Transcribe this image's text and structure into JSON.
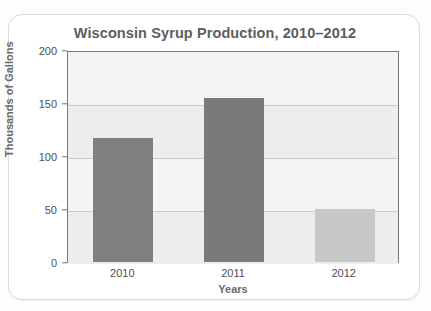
{
  "card": {
    "accent_color": "#808080",
    "border_color": "#dcdcdc"
  },
  "chart_data": {
    "type": "bar",
    "title": "Wisconsin Syrup Production, 2010–2012",
    "xlabel": "Years",
    "ylabel": "Thousands of Gallons",
    "categories": [
      "2010",
      "2011",
      "2012"
    ],
    "values": [
      117,
      155,
      50
    ],
    "bar_colors": [
      "#808080",
      "#7a7a7a",
      "#c8c8c8"
    ],
    "ylim": [
      0,
      200
    ],
    "yticks": [
      0,
      50,
      100,
      150,
      200
    ],
    "ytick_labels": [
      "0",
      "50",
      "100",
      "150",
      "200"
    ],
    "grid": true,
    "legend": "none",
    "plot_background": "#f1f1f1"
  }
}
